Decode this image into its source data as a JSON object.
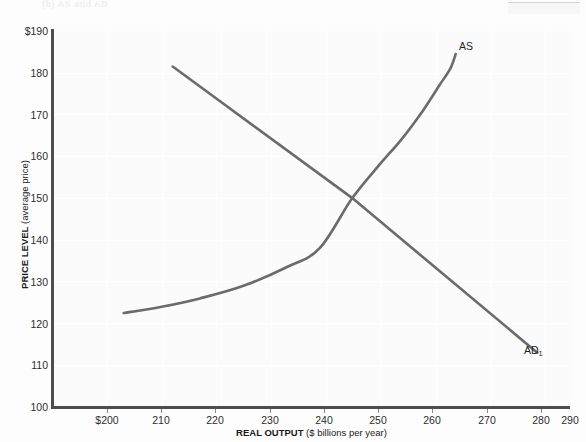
{
  "figure": {
    "artifact_caption": "(b) AS and AD",
    "line_color": "#6b6b6b",
    "axis_color": "#4d4d4d"
  },
  "chart_data": {
    "type": "line",
    "title": "",
    "xlabel_bold": "REAL OUTPUT",
    "xlabel_rest": " ($ billions per year)",
    "ylabel_bold": "PRICE LEVEL",
    "ylabel_rest": " (average price)",
    "xlim": [
      195,
      290
    ],
    "ylim": [
      100,
      190
    ],
    "xticks": [
      "$200",
      "210",
      "220",
      "230",
      "240",
      "250",
      "260",
      "270",
      "280",
      "290"
    ],
    "xtick_values": [
      200,
      210,
      220,
      230,
      240,
      250,
      260,
      270,
      280,
      290
    ],
    "yticks": [
      "$190",
      "180",
      "170",
      "160",
      "150",
      "140",
      "130",
      "120",
      "110",
      "100"
    ],
    "ytick_values": [
      190,
      180,
      170,
      160,
      150,
      140,
      130,
      120,
      110,
      100
    ],
    "grid": true,
    "legend": "none",
    "equilibrium": {
      "output": 250,
      "price_level": 150
    },
    "series": [
      {
        "name": "AS",
        "label": "AS",
        "label_sub": "",
        "type": "aggregate-supply",
        "shape": "upward-sloping convex",
        "points": [
          [
            208,
            122.5
          ],
          [
            215,
            124
          ],
          [
            222,
            126
          ],
          [
            230,
            129
          ],
          [
            238,
            133.5
          ],
          [
            244,
            138
          ],
          [
            250,
            150
          ],
          [
            255,
            158
          ],
          [
            259,
            164
          ],
          [
            263,
            171
          ],
          [
            266,
            177
          ],
          [
            268,
            181
          ],
          [
            269,
            184.5
          ]
        ]
      },
      {
        "name": "AD1",
        "label": "AD",
        "label_sub": "1",
        "type": "aggregate-demand",
        "shape": "downward-sloping straight",
        "points": [
          [
            217,
            181.5
          ],
          [
            250,
            150
          ],
          [
            284,
            113
          ]
        ]
      }
    ]
  }
}
